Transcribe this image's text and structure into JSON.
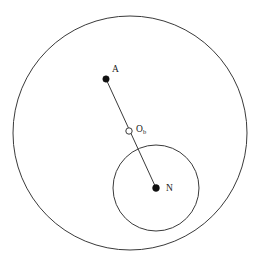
{
  "figure": {
    "title": "",
    "background_color": "#ffffff",
    "stroke_color": "#3a3a3a",
    "marker_fill_color": "#111111",
    "label_color": "#1a1a1a",
    "width": 265,
    "height": 265
  },
  "labels": {
    "point_a": "A",
    "point_ob_base": "O",
    "point_ob_sub": "b",
    "point_n": "N"
  },
  "chart_data": {
    "type": "diagram",
    "title": "",
    "xlabel": "",
    "ylabel": "",
    "coordinate_system": "pixel, origin top-left, 265x265",
    "circles": [
      {
        "name": "outer-circle",
        "cx": 130,
        "cy": 133,
        "r": 117,
        "stroke": "#3a3a3a",
        "stroke_width": 1,
        "fill": "none"
      },
      {
        "name": "inner-circle",
        "cx": 156,
        "cy": 188,
        "r": 43,
        "stroke": "#3a3a3a",
        "stroke_width": 1,
        "fill": "none"
      }
    ],
    "points": [
      {
        "name": "A",
        "label": "A",
        "x": 106,
        "y": 79,
        "marker": "filled-dot",
        "radius": 3.2,
        "label_offset": [
          6,
          -14
        ]
      },
      {
        "name": "Ob",
        "label": "O_b",
        "x": 129,
        "y": 131,
        "marker": "open-circle",
        "radius": 3.2,
        "label_offset": [
          7,
          -6
        ]
      },
      {
        "name": "N",
        "label": "N",
        "x": 156,
        "y": 188,
        "marker": "filled-dot",
        "radius": 3.4,
        "label_offset": [
          10,
          -4
        ]
      }
    ],
    "segments": [
      {
        "name": "segment-A-N",
        "from": "A",
        "to": "N",
        "x1": 106,
        "y1": 79,
        "x2": 156,
        "y2": 188,
        "passes_through": "Ob",
        "stroke": "#3a3a3a",
        "stroke_width": 1
      }
    ],
    "legend": [],
    "annotations": [],
    "grid": false
  }
}
